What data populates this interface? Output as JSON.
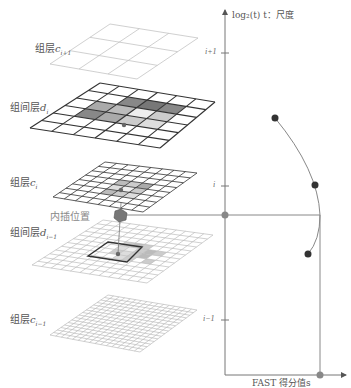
{
  "layers": [
    {
      "id": "c_i+1",
      "label": "组层",
      "var": "c",
      "sub": "i+1",
      "grid": 3,
      "style": "light"
    },
    {
      "id": "d_i",
      "label": "组间层",
      "var": "d",
      "sub": "i",
      "grid": 6,
      "style": "dark"
    },
    {
      "id": "c_i",
      "label": "组层",
      "var": "c",
      "sub": "i",
      "grid": 8,
      "style": "dark"
    },
    {
      "id": "d_i-1",
      "label": "组间层",
      "var": "d",
      "sub": "i−1",
      "grid": 12,
      "style": "light"
    },
    {
      "id": "c_i-1",
      "label": "组层",
      "var": "c",
      "sub": "i−1",
      "grid": 16,
      "style": "light"
    }
  ],
  "interp_label": "内插位置",
  "axis": {
    "y_label": "log₂(t) t：尺度",
    "x_label": "FAST 得分值s",
    "ticks": [
      "i+1",
      "i",
      "i−1"
    ]
  },
  "chart_data": {
    "type": "line",
    "title": "",
    "xlabel": "FAST 得分值s",
    "ylabel": "log₂(t) t：尺度",
    "y_ticks": [
      "i-1",
      "i",
      "i+1"
    ],
    "points": [
      {
        "scale": "i+0.5",
        "score": "low",
        "label": "d_i"
      },
      {
        "scale": "i",
        "score": "mid-high",
        "label": "c_i"
      },
      {
        "scale": "i-0.5",
        "score": "mid",
        "label": "d_i-1"
      }
    ],
    "fitted_maximum": {
      "scale": "between i and i-1 (interpolated)",
      "score": "max"
    },
    "colors": {
      "points": "#333333",
      "curve": "#888888",
      "max_marker": "#888888"
    }
  }
}
